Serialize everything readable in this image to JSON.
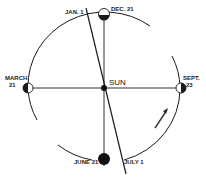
{
  "diagram": {
    "center_label": "SUN",
    "positions": [
      {
        "id": "dec21",
        "label": "DEC. 21",
        "shading": "bottom"
      },
      {
        "id": "march21",
        "label_line1": "MARCH",
        "label_line2": "21",
        "shading": "left"
      },
      {
        "id": "sept23",
        "label_line1": "SEPT.",
        "label_line2": "23",
        "shading": "right"
      },
      {
        "id": "june21",
        "label": "JUNE 21",
        "shading": "full"
      }
    ],
    "axis_labels": {
      "top": "JAN. 1",
      "bottom": "JULY 1"
    },
    "direction_arrow": "counterclockwise orbital motion",
    "colors": {
      "line": "#1a1a1a",
      "background": "#ffffff"
    }
  }
}
